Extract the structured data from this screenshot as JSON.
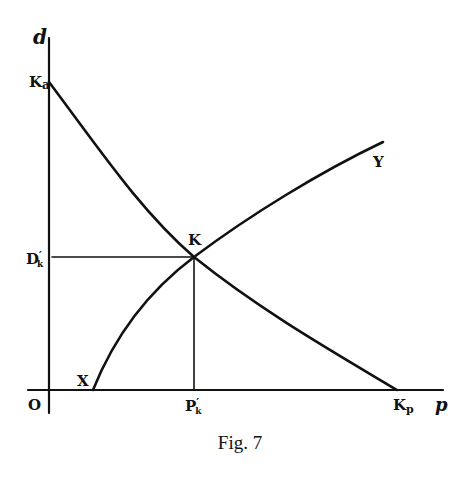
{
  "figure": {
    "caption": "Fig. 7",
    "axes": {
      "y_label": "d",
      "x_label": "p",
      "origin_label": "O"
    },
    "curves": [
      {
        "name": "KaKp",
        "description": "Downward-sloping curve from Ka on the d-axis to Kp on the p-axis",
        "start_label": "Ka",
        "end_label": "Kp"
      },
      {
        "name": "XY",
        "description": "Upward-sloping concave curve from X on the p-axis to Y",
        "start_label": "X",
        "end_label": "Y"
      }
    ],
    "intersection": {
      "label": "K",
      "d_projection_label": "D'k",
      "p_projection_label": "P'k"
    },
    "labels": {
      "d": "d",
      "p": "p",
      "o": "O",
      "ka_main": "K",
      "ka_sub": "a",
      "kp_main": "K",
      "kp_sub": "p",
      "k": "K",
      "x": "X",
      "y": "Y",
      "dk_main": "D",
      "dk_prime": "′",
      "dk_sub": "k",
      "pk_main": "P",
      "pk_prime": "′",
      "pk_sub": "k"
    },
    "colors": {
      "ink": "#111111",
      "paper": "#ffffff"
    }
  }
}
